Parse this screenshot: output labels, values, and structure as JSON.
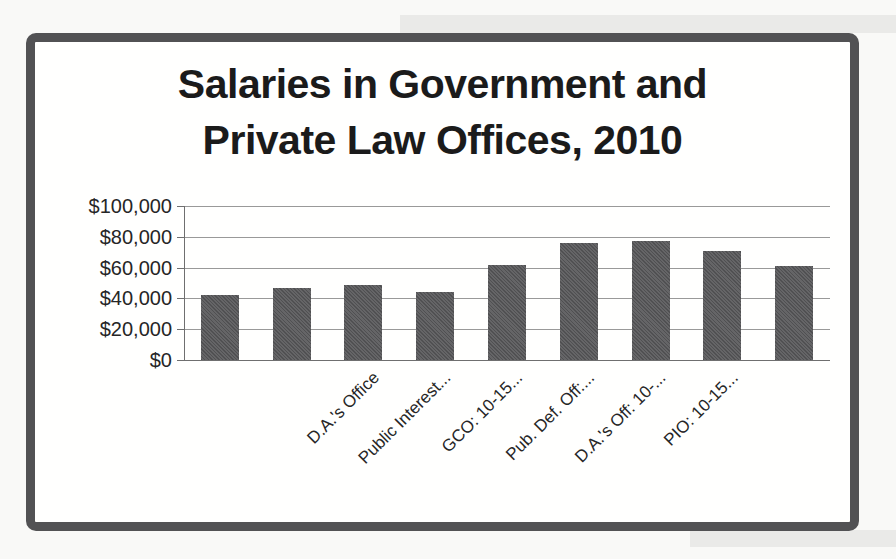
{
  "page": {
    "background": "#f9f9f7",
    "kind": "scanned textbook chart"
  },
  "frame": {
    "color": "#525254",
    "fill": "#fffffe"
  },
  "scan_artifacts": {
    "color": "#eaeae8"
  },
  "chart_data": {
    "type": "bar",
    "title": "Salaries in Government and Private Law Offices, 2010",
    "title_lines": [
      "Salaries in Government and",
      "Private Law Offices, 2010"
    ],
    "xlabel": "",
    "ylabel": "",
    "ylim": [
      0,
      100000
    ],
    "grid": true,
    "legend": "none",
    "bar_count": 9,
    "values": [
      42000,
      47000,
      49000,
      44000,
      62000,
      76000,
      77000,
      71000,
      61000
    ],
    "yticks": {
      "values": [
        100000,
        80000,
        60000,
        40000,
        20000,
        0
      ],
      "labels": [
        "$100,000",
        "$80,000",
        "$60,000",
        "$40,000",
        "$20,000",
        "$0"
      ]
    },
    "xtick_labels_visible": [
      "D.A.'s Office",
      "Public Interest...",
      "GCO: 10-15...",
      "Pub. Def. Off:...",
      "D.A.'s Off: 10-...",
      "PIO: 10-15..."
    ],
    "xtick_label_bar_index": [
      3,
      4,
      5,
      6,
      7,
      8
    ],
    "xtick_rotation_deg": 45,
    "bar_color": "#5d5d5f",
    "gridline_color": "#999999",
    "axis_color": "#6f6f6f",
    "text_color": "#262626",
    "title_color": "#1b1b1b"
  }
}
